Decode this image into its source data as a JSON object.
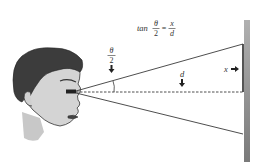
{
  "diagram": {
    "formula": {
      "prefix": "tan",
      "lhs_numerator": "θ",
      "lhs_denominator": "2",
      "equals": "=",
      "rhs_numerator": "x",
      "rhs_denominator": "d"
    },
    "labels": {
      "half_angle_numerator": "θ",
      "half_angle_denominator": "2",
      "distance": "d",
      "half_width": "x"
    },
    "colors": {
      "wall_light": "#a8a8a8",
      "wall_dark": "#777777",
      "line": "#3a3a3a",
      "face_skin": "#d4d4d4",
      "hair": "#3c3c3c"
    }
  }
}
